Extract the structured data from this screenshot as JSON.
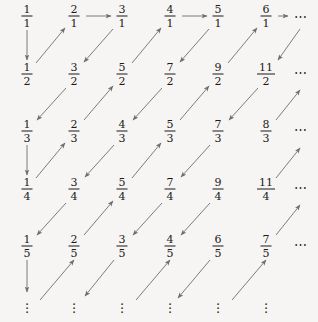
{
  "figure": {
    "background_color": "#f6f5f3",
    "text_color": "#1b1b1b",
    "arrow_color": "#6e6e6e",
    "columns": 6,
    "rows": 5,
    "column_x": [
      27,
      74,
      122,
      170,
      218,
      266,
      300
    ],
    "row_y": [
      16,
      74,
      131,
      189,
      246,
      305
    ],
    "row_end_ellipsis": "⋯",
    "column_end_ellipsis": "⋮"
  },
  "grid": {
    "rows": [
      {
        "denominator": "1",
        "cells": [
          {
            "num": "1",
            "den": "1"
          },
          {
            "num": "2",
            "den": "1"
          },
          {
            "num": "3",
            "den": "1"
          },
          {
            "num": "4",
            "den": "1"
          },
          {
            "num": "5",
            "den": "1"
          },
          {
            "num": "6",
            "den": "1"
          }
        ],
        "trailing": "⋯"
      },
      {
        "denominator": "2",
        "cells": [
          {
            "num": "1",
            "den": "2"
          },
          {
            "num": "3",
            "den": "2"
          },
          {
            "num": "5",
            "den": "2"
          },
          {
            "num": "7",
            "den": "2"
          },
          {
            "num": "9",
            "den": "2"
          },
          {
            "num": "11",
            "den": "2"
          }
        ],
        "trailing": "⋯"
      },
      {
        "denominator": "3",
        "cells": [
          {
            "num": "1",
            "den": "3"
          },
          {
            "num": "2",
            "den": "3"
          },
          {
            "num": "4",
            "den": "3"
          },
          {
            "num": "5",
            "den": "3"
          },
          {
            "num": "7",
            "den": "3"
          },
          {
            "num": "8",
            "den": "3"
          }
        ],
        "trailing": "⋯"
      },
      {
        "denominator": "4",
        "cells": [
          {
            "num": "1",
            "den": "4"
          },
          {
            "num": "3",
            "den": "4"
          },
          {
            "num": "5",
            "den": "4"
          },
          {
            "num": "7",
            "den": "4"
          },
          {
            "num": "9",
            "den": "4"
          },
          {
            "num": "11",
            "den": "4"
          }
        ],
        "trailing": "⋯"
      },
      {
        "denominator": "5",
        "cells": [
          {
            "num": "1",
            "den": "5"
          },
          {
            "num": "2",
            "den": "5"
          },
          {
            "num": "3",
            "den": "5"
          },
          {
            "num": "4",
            "den": "5"
          },
          {
            "num": "6",
            "den": "5"
          },
          {
            "num": "7",
            "den": "5"
          }
        ],
        "trailing": "⋯"
      }
    ],
    "bottom_ellipses": [
      "⋮",
      "⋮",
      "⋮",
      "⋮",
      "⋮",
      "⋮"
    ]
  },
  "paths": {
    "description": "Zig-zag traversal arrows connecting the fractions",
    "segments": [
      {
        "kind": "vertical-down",
        "from": "1/1",
        "to": "1/2"
      },
      {
        "kind": "diagonal-up-right",
        "from": "1/2",
        "to": "2/1"
      },
      {
        "kind": "horizontal-right",
        "from": "2/1",
        "to": "3/1"
      },
      {
        "kind": "diagonal-down-left",
        "from": "3/1",
        "to": "3/2"
      },
      {
        "kind": "diagonal-up-right",
        "from": "5/2",
        "to": "4/1"
      },
      {
        "kind": "horizontal-right",
        "from": "4/1",
        "to": "5/1"
      },
      {
        "kind": "diagonal-down-left",
        "from": "5/1",
        "to": "7/2"
      },
      {
        "kind": "diagonal-up-right",
        "from": "9/2",
        "to": "6/1"
      },
      {
        "kind": "horizontal-right",
        "from": "6/1",
        "to": "⋯"
      },
      {
        "kind": "diagonal-down-left",
        "from": "⋯",
        "to": "11/2"
      },
      {
        "kind": "diagonal-down-left",
        "from": "3/2",
        "to": "1/3"
      },
      {
        "kind": "diagonal-up-right",
        "from": "2/3",
        "to": "5/2"
      },
      {
        "kind": "diagonal-down-left",
        "from": "7/2",
        "to": "4/3"
      },
      {
        "kind": "diagonal-up-right",
        "from": "5/3",
        "to": "9/2"
      },
      {
        "kind": "diagonal-down-left",
        "from": "11/2",
        "to": "7/3"
      },
      {
        "kind": "diagonal-up-right",
        "from": "8/3",
        "to": "⋯"
      },
      {
        "kind": "vertical-down",
        "from": "1/3",
        "to": "1/4"
      },
      {
        "kind": "diagonal-up-right",
        "from": "1/4",
        "to": "2/3"
      },
      {
        "kind": "diagonal-down-left",
        "from": "4/3",
        "to": "3/4"
      },
      {
        "kind": "diagonal-up-right",
        "from": "5/4",
        "to": "5/3"
      },
      {
        "kind": "diagonal-down-left",
        "from": "7/3",
        "to": "9/4"
      },
      {
        "kind": "diagonal-up-right",
        "from": "11/4",
        "to": "8/3"
      },
      {
        "kind": "diagonal-down-left",
        "from": "3/4",
        "to": "1/5"
      },
      {
        "kind": "diagonal-up-right",
        "from": "2/5",
        "to": "5/4"
      },
      {
        "kind": "diagonal-down-left",
        "from": "9/4",
        "to": "6/5"
      },
      {
        "kind": "diagonal-up-right",
        "from": "7/5",
        "to": "11/4"
      },
      {
        "kind": "vertical-down",
        "from": "1/5",
        "to": "⋮"
      },
      {
        "kind": "diagonal-up-right",
        "from": "⋮",
        "to": "2/5"
      },
      {
        "kind": "diagonal-down-left",
        "from": "6/5",
        "to": "⋮"
      },
      {
        "kind": "diagonal-up-right",
        "from": "⋮",
        "to": "7/5"
      }
    ]
  }
}
